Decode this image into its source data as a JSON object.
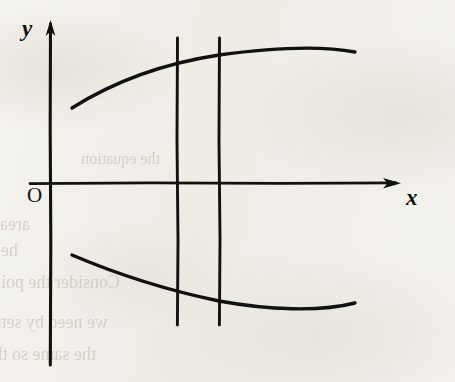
{
  "figure": {
    "background_color": "#f3f1ed",
    "ink_color": "#111110",
    "axes": {
      "y_axis_label": "y",
      "x_axis_label": "x",
      "origin_label": "O",
      "y_axis_x_px": 50,
      "x_axis_y_px": 183,
      "y_axis_top_px": 22,
      "y_axis_bottom_px": 365,
      "x_axis_left_px": 30,
      "x_axis_right_px": 398,
      "arrowheads": [
        "y-axis-up",
        "x-axis-right"
      ]
    }
  },
  "chart_data": {
    "type": "line",
    "title": "",
    "xlabel": "x",
    "ylabel": "y",
    "grid": false,
    "legend": "none",
    "axis_origin_label": "O",
    "note": "Two concave arcs (upper opening downward, lower opening upward) crossed by two vertical lines; hand-drawn textbook figure, no numeric tick labels.",
    "series": [
      {
        "name": "upper-curve",
        "kind": "arc-concave-down",
        "points_px": [
          [
            72,
            108
          ],
          [
            110,
            88
          ],
          [
            150,
            72
          ],
          [
            177,
            64
          ],
          [
            200,
            58
          ],
          [
            219,
            55
          ],
          [
            250,
            50
          ],
          [
            290,
            47
          ],
          [
            320,
            47
          ],
          [
            355,
            52
          ]
        ]
      },
      {
        "name": "lower-curve",
        "kind": "arc-concave-up",
        "points_px": [
          [
            72,
            255
          ],
          [
            110,
            268
          ],
          [
            150,
            283
          ],
          [
            177,
            291
          ],
          [
            200,
            297
          ],
          [
            219,
            301
          ],
          [
            250,
            306
          ],
          [
            290,
            310
          ],
          [
            320,
            309
          ],
          [
            355,
            303
          ]
        ]
      }
    ],
    "vertical_lines": [
      {
        "name": "vertical-line-left",
        "x_px": 177,
        "y_top_px": 38,
        "y_bottom_px": 325
      },
      {
        "name": "vertical-line-right",
        "x_px": 219,
        "y_top_px": 38,
        "y_bottom_px": 325
      }
    ]
  },
  "ghost_text": {
    "note": "Faint mirrored show-through text bleeding from the reverse page side; not part of the figure.",
    "lines": [
      {
        "text": "area marks this side by a filling the",
        "left": 30,
        "top": 214,
        "size": 18
      },
      {
        "text": "he axis of distance the concern is",
        "left": 18,
        "top": 240,
        "size": 18
      },
      {
        "text": "Consider the point",
        "left": 120,
        "top": 272,
        "size": 18
      },
      {
        "text": "we need by setting",
        "left": 108,
        "top": 312,
        "size": 18
      },
      {
        "text": "the same so the error",
        "left": 96,
        "top": 344,
        "size": 18
      },
      {
        "text": "the equation",
        "left": 160,
        "top": 150,
        "size": 16
      }
    ]
  }
}
